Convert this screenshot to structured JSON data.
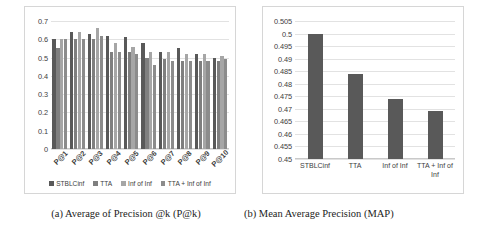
{
  "figure": {
    "panel_a": {
      "caption": "(a) Average of Precision @k (P@k)",
      "chart_data": {
        "type": "bar",
        "title": "",
        "xlabel": "",
        "ylabel": "",
        "ylim": [
          0,
          0.7
        ],
        "yticks": [
          "0",
          "0.1",
          "0.2",
          "0.3",
          "0.4",
          "0.5",
          "0.6",
          "0.7"
        ],
        "grid": true,
        "legend_position": "bottom",
        "categories": [
          "P@1",
          "P@2",
          "P@3",
          "P@4",
          "P@5",
          "P@6",
          "P@7",
          "P@8",
          "P@9",
          "P@10"
        ],
        "series": [
          {
            "name": "STBLCinf",
            "color": "#595959",
            "values": [
              0.6,
              0.64,
              0.63,
              0.62,
              0.61,
              0.58,
              0.53,
              0.55,
              0.52,
              0.5
            ]
          },
          {
            "name": "TTA",
            "color": "#7f7f7f",
            "values": [
              0.55,
              0.6,
              0.6,
              0.53,
              0.53,
              0.5,
              0.49,
              0.48,
              0.48,
              0.48
            ]
          },
          {
            "name": "Inf of Inf",
            "color": "#a6a6a6",
            "values": [
              0.6,
              0.64,
              0.66,
              0.58,
              0.56,
              0.53,
              0.53,
              0.52,
              0.52,
              0.51
            ]
          },
          {
            "name": "TTA + Inf of Inf",
            "color": "#8c8c8c",
            "values": [
              0.6,
              0.6,
              0.62,
              0.53,
              0.52,
              0.46,
              0.48,
              0.48,
              0.48,
              0.49
            ]
          }
        ]
      }
    },
    "panel_b": {
      "caption": "(b) Mean Average Precision (MAP)",
      "chart_data": {
        "type": "bar",
        "title": "",
        "xlabel": "",
        "ylabel": "",
        "ylim": [
          0.45,
          0.505
        ],
        "yticks": [
          "0.45",
          "0.455",
          "0.46",
          "0.465",
          "0.47",
          "0.475",
          "0.48",
          "0.485",
          "0.49",
          "0.495",
          "0.5",
          "0.505"
        ],
        "grid": true,
        "legend_position": "none",
        "bar_color": "#595959",
        "categories": [
          "STBLCinf",
          "TTA",
          "Inf of Inf",
          "TTA + Inf of Inf"
        ],
        "values": [
          0.5,
          0.484,
          0.474,
          0.469
        ]
      }
    }
  }
}
